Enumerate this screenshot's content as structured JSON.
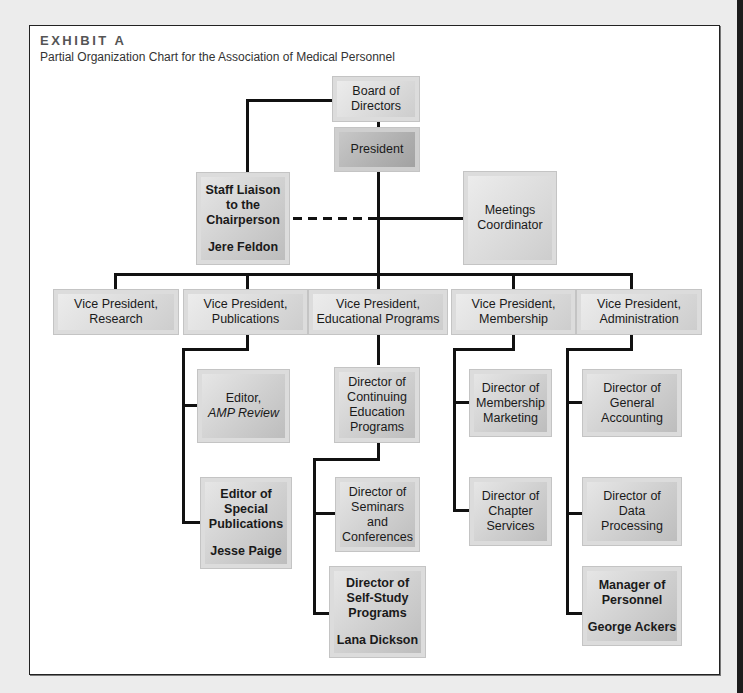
{
  "header": {
    "exhibit_label": "EXHIBIT A",
    "title": "Partial Organization Chart for the Association of Medical Personnel"
  },
  "colors": {
    "box_fill": "#cfcfcf",
    "line": "#111111",
    "page_bg": "#ececec",
    "frame_bg": "#ffffff"
  },
  "chart": {
    "board": {
      "line1": "Board of",
      "line2": "Directors"
    },
    "president": {
      "label": "President"
    },
    "staff_liaison": {
      "line1": "Staff Liaison",
      "line2": "to the",
      "line3": "Chairperson",
      "person": "Jere Feldon"
    },
    "meetings": {
      "line1": "Meetings",
      "line2": "Coordinator"
    },
    "vps": [
      {
        "line1": "Vice President,",
        "line2": "Research"
      },
      {
        "line1": "Vice President,",
        "line2": "Publications"
      },
      {
        "line1": "Vice President,",
        "line2": "Educational Programs"
      },
      {
        "line1": "Vice President,",
        "line2": "Membership"
      },
      {
        "line1": "Vice President,",
        "line2": "Administration"
      }
    ],
    "publications": {
      "editor_amp": {
        "line1": "Editor,",
        "line2": "AMP Review"
      },
      "editor_special": {
        "line1": "Editor of",
        "line2": "Special",
        "line3": "Publications",
        "person": "Jesse Paige"
      }
    },
    "education": {
      "continuing": {
        "line1": "Director of",
        "line2": "Continuing",
        "line3": "Education",
        "line4": "Programs"
      },
      "seminars": {
        "line1": "Director of",
        "line2": "Seminars",
        "line3": "and",
        "line4": "Conferences"
      },
      "self_study": {
        "line1": "Director of",
        "line2": "Self-Study",
        "line3": "Programs",
        "person": "Lana Dickson"
      }
    },
    "membership": {
      "marketing": {
        "line1": "Director of",
        "line2": "Membership",
        "line3": "Marketing"
      },
      "chapter": {
        "line1": "Director of",
        "line2": "Chapter",
        "line3": "Services"
      }
    },
    "administration": {
      "accounting": {
        "line1": "Director of",
        "line2": "General",
        "line3": "Accounting"
      },
      "data": {
        "line1": "Director of",
        "line2": "Data",
        "line3": "Processing"
      },
      "personnel": {
        "line1": "Manager of",
        "line2": "Personnel",
        "person": "George Ackers"
      }
    }
  }
}
